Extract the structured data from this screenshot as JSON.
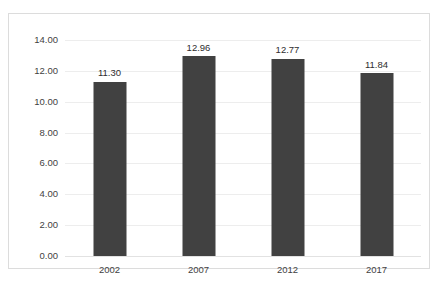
{
  "chart_data": {
    "type": "bar",
    "title": "",
    "subtitle": "",
    "xlabel": "",
    "ylabel": "",
    "categories": [
      "2002",
      "2007",
      "2012",
      "2017"
    ],
    "values": [
      11.3,
      12.96,
      12.77,
      11.84
    ],
    "data_labels": [
      "11.30",
      "12.96",
      "12.77",
      "11.84"
    ],
    "ylim": [
      0,
      14
    ],
    "ytick_labels": [
      "14.00",
      "12.00",
      "10.00",
      "8.00",
      "6.00",
      "4.00",
      "2.00",
      "0.00"
    ],
    "ytick_values": [
      14,
      12,
      10,
      8,
      6,
      4,
      2,
      0
    ],
    "grid": true,
    "legend": false,
    "legend_position": "none",
    "bar_color": "#414141",
    "gridline_color": "#ededed",
    "frame_color": "#dcdcdc",
    "background_color": "#ffffff",
    "label_color": "#3f3f3f"
  },
  "footer": {
    "source_note": ""
  }
}
